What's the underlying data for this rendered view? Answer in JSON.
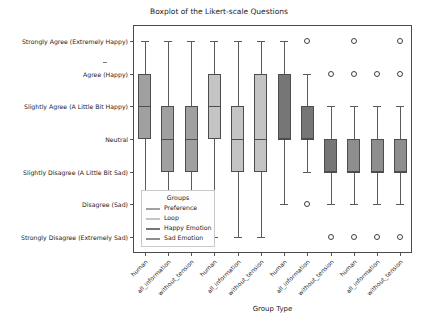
{
  "chart_data": {
    "type": "boxplot",
    "title": "Boxplot of the Likert-scale Questions",
    "xlabel": "Group Type",
    "ylabel": "",
    "y_categories": [
      "Strongly Agree (Extremely Happy)",
      "Agree (Happy)",
      "Slightly Agree (A Little Bit Happy)",
      "Neutral",
      "Slightly Disagree (A Little Bit Sad)",
      "Disagree (Sad)",
      "Strongly Disagree (Extremely Sad)"
    ],
    "y_values": [
      7,
      6,
      5,
      4,
      3,
      2,
      1
    ],
    "ylim": [
      0.5,
      7.5
    ],
    "grid": false,
    "legend": {
      "title": "Groups",
      "position": "lower-left-inside",
      "entries": [
        {
          "label": "Preference",
          "color": "#a0a0a0"
        },
        {
          "label": "Loop",
          "color": "#c4c4c4"
        },
        {
          "label": "Happy Emotion",
          "color": "#767676"
        },
        {
          "label": "Sad Emotion",
          "color": "#8e8e8e"
        }
      ]
    },
    "categories": [
      "human",
      "all_information",
      "without_tension",
      "human",
      "all_information",
      "without_tension",
      "human",
      "all_information",
      "without_tension",
      "human",
      "all_information",
      "without_tension"
    ],
    "boxes": [
      {
        "group": "Preference",
        "category": "human",
        "q1": 4,
        "median": 5,
        "q3": 6,
        "whisker_low": 2,
        "whisker_high": 7,
        "fliers": []
      },
      {
        "group": "Preference",
        "category": "all_information",
        "q1": 3,
        "median": 4,
        "q3": 5,
        "whisker_low": 2,
        "whisker_high": 7,
        "fliers": []
      },
      {
        "group": "Preference",
        "category": "without_tension",
        "q1": 3,
        "median": 4,
        "q3": 5,
        "whisker_low": 2,
        "whisker_high": 7,
        "fliers": []
      },
      {
        "group": "Loop",
        "category": "human",
        "q1": 4,
        "median": 5,
        "q3": 6,
        "whisker_low": 1,
        "whisker_high": 7,
        "fliers": []
      },
      {
        "group": "Loop",
        "category": "all_information",
        "q1": 3,
        "median": 4,
        "q3": 5,
        "whisker_low": 1,
        "whisker_high": 7,
        "fliers": []
      },
      {
        "group": "Loop",
        "category": "without_tension",
        "q1": 3,
        "median": 4,
        "q3": 6,
        "whisker_low": 1,
        "whisker_high": 7,
        "fliers": []
      },
      {
        "group": "Happy Emotion",
        "category": "human",
        "q1": 4,
        "median": 4,
        "q3": 6,
        "whisker_low": 2,
        "whisker_high": 7,
        "fliers": []
      },
      {
        "group": "Happy Emotion",
        "category": "all_information",
        "q1": 4,
        "median": 4,
        "q3": 5,
        "whisker_low": 3,
        "whisker_high": 6,
        "fliers": [
          7,
          2
        ]
      },
      {
        "group": "Happy Emotion",
        "category": "without_tension",
        "q1": 3,
        "median": 3,
        "q3": 4,
        "whisker_low": 2,
        "whisker_high": 5,
        "fliers": [
          6,
          1
        ]
      },
      {
        "group": "Sad Emotion",
        "category": "human",
        "q1": 3,
        "median": 3,
        "q3": 4,
        "whisker_low": 2,
        "whisker_high": 5,
        "fliers": [
          7,
          6,
          1
        ]
      },
      {
        "group": "Sad Emotion",
        "category": "all_information",
        "q1": 3,
        "median": 3,
        "q3": 4,
        "whisker_low": 2,
        "whisker_high": 5,
        "fliers": [
          6,
          1
        ]
      },
      {
        "group": "Sad Emotion",
        "category": "without_tension",
        "q1": 3,
        "median": 3,
        "q3": 4,
        "whisker_low": 2,
        "whisker_high": 5,
        "fliers": [
          7,
          6,
          1
        ]
      }
    ]
  },
  "figure": {
    "title": "Boxplot of the Likert-scale Questions",
    "xlabel": "Group Type"
  }
}
